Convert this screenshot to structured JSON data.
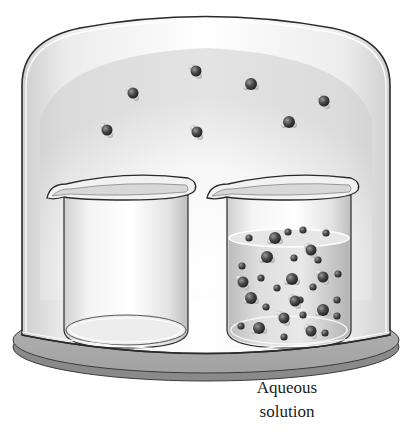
{
  "diagram": {
    "title": "",
    "labels": {
      "aqueous_line1": "Aqueous",
      "aqueous_line2": "solution"
    },
    "components": {
      "bell_jar": "glass-bell-jar",
      "base_plate": "base-plate",
      "left_beaker": "empty-beaker",
      "right_beaker": "beaker-with-aqueous-solution"
    },
    "gas_molecules": [
      {
        "x": 44,
        "y": 43
      },
      {
        "x": 66,
        "y": 31
      },
      {
        "x": 83,
        "y": 28
      },
      {
        "x": 108,
        "y": 43
      },
      {
        "x": 35,
        "y": 130
      },
      {
        "x": 66,
        "y": 132
      }
    ],
    "vapor_molecules": [
      {
        "x": 133,
        "y": 93
      },
      {
        "x": 196,
        "y": 70
      },
      {
        "x": 251,
        "y": 84
      },
      {
        "x": 324,
        "y": 101
      },
      {
        "x": 107,
        "y": 130
      },
      {
        "x": 197,
        "y": 132
      },
      {
        "x": 289,
        "y": 122
      }
    ],
    "colors": {
      "outline": "#2a2a2a",
      "glass_fill": "#e6e6e6",
      "plate": "#9a9a9a",
      "molecule": "#3a3a3a",
      "hydrogen": "#c8c8c8"
    }
  }
}
